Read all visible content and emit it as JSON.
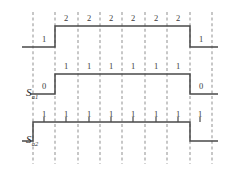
{
  "figure": {
    "type": "digital-timing-diagram",
    "width": 228,
    "height": 172,
    "background_color": "#ffffff",
    "wave_color": "#4a4a4a",
    "gridline_color": "#9a9a9a",
    "label_color": "#3a3a3a"
  },
  "gridlines": {
    "count": 9,
    "x_positions": [
      33,
      55,
      78,
      100,
      122,
      145,
      167,
      190,
      212
    ],
    "style": "dashed",
    "orientation": "vertical"
  },
  "traces": [
    {
      "id": "trace-top",
      "label": "",
      "label_base": "",
      "label_sub": "",
      "baseline_y": 47,
      "high_y": 26,
      "rise_x": 55,
      "fall_x": 190,
      "start_x": 22,
      "end_x": 218,
      "low_level_value_left": "1",
      "low_level_value_right": "1",
      "high_level_value": "2",
      "high_labels": [
        "2",
        "2",
        "2",
        "2",
        "2",
        "2"
      ],
      "high_label_x": [
        66,
        89,
        111,
        133,
        156,
        178
      ],
      "high_label_y": 18,
      "low_label_left_x": 44,
      "low_label_right_x": 201,
      "low_label_y": 39,
      "has_tickmarks": false
    },
    {
      "id": "trace-sa1",
      "label": "Sa1",
      "label_base": "S",
      "label_sub": "a1",
      "baseline_y": 94,
      "high_y": 74,
      "rise_x": 55,
      "fall_x": 190,
      "start_x": 30,
      "end_x": 218,
      "low_level_value_left": "0",
      "low_level_value_right": "0",
      "high_level_value": "1",
      "high_labels": [
        "1",
        "1",
        "1",
        "1",
        "1",
        "1"
      ],
      "high_label_x": [
        66,
        89,
        111,
        133,
        156,
        178
      ],
      "high_label_y": 66,
      "low_label_left_x": 44,
      "low_label_right_x": 201,
      "low_label_y": 86,
      "has_tickmarks": false,
      "label_x": 38,
      "label_y": 92
    },
    {
      "id": "trace-sa2",
      "label": "Sa2",
      "label_base": "S",
      "label_sub": "a2",
      "baseline_y": 141,
      "high_y": 122,
      "rise_x": 33,
      "fall_x": 190,
      "start_x": 22,
      "end_x": 218,
      "low_level_value_left": "",
      "low_level_value_right": "",
      "high_level_value": "1",
      "high_labels": [
        "1",
        "1",
        "1",
        "1",
        "1",
        "1",
        "1",
        "1"
      ],
      "high_label_x": [
        44,
        66,
        89,
        111,
        133,
        156,
        178,
        200
      ],
      "high_label_y": 114,
      "has_tickmarks": true,
      "tickmark_x": [
        44,
        66,
        89,
        111,
        133,
        156,
        178,
        200
      ],
      "tickmark_top_y": 117,
      "label_x": 38,
      "label_y": 139
    }
  ]
}
